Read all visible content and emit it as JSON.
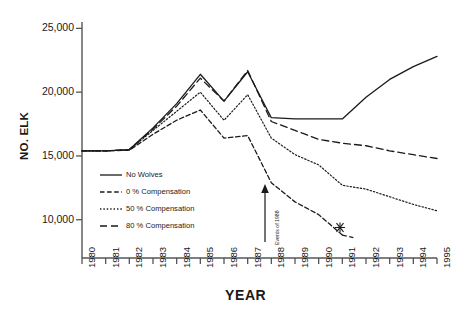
{
  "chart_data": {
    "type": "line",
    "title": "",
    "xlabel": "YEAR",
    "ylabel": "NO. ELK",
    "x": [
      1980,
      1981,
      1982,
      1983,
      1984,
      1985,
      1986,
      1987,
      1988,
      1989,
      1990,
      1991,
      1992,
      1993,
      1994,
      1995
    ],
    "categories": [
      "1980",
      "1981",
      "1982",
      "1983",
      "1984",
      "1985",
      "1986",
      "1987",
      "1988",
      "1989",
      "1990",
      "1991",
      "1992",
      "1993",
      "1994",
      "1995"
    ],
    "xlim": [
      1980,
      1995
    ],
    "ylim": [
      7000,
      25500
    ],
    "yticks": [
      10000,
      15000,
      20000,
      25000
    ],
    "ytick_labels": [
      "10,000",
      "15,000",
      "20,000",
      "25,000"
    ],
    "grid": false,
    "legend_position": "inside-lower-left",
    "series": [
      {
        "name": "No Wolves",
        "style": "solid",
        "values": [
          15400,
          15400,
          15500,
          17200,
          19100,
          21400,
          19300,
          21600,
          18000,
          17900,
          17900,
          17900,
          19600,
          21000,
          22000,
          22800
        ]
      },
      {
        "name": "0 % Compensation",
        "style": "dash-dot",
        "values": [
          15400,
          15400,
          15450,
          16700,
          17800,
          18600,
          16400,
          16600,
          12900,
          11400,
          10400,
          8800,
          null,
          null,
          null,
          null
        ],
        "end_marker": "asterisk",
        "end_marker_year": 1991,
        "end_marker_value": 8600
      },
      {
        "name": "50 % Compensation",
        "style": "dotted",
        "values": [
          15400,
          15400,
          15480,
          17000,
          18500,
          20000,
          17800,
          19800,
          16400,
          15100,
          14300,
          12700,
          12400,
          11800,
          11200,
          10700
        ]
      },
      {
        "name": "80 % Compensation",
        "style": "dashed",
        "values": [
          15400,
          15400,
          15500,
          17100,
          18900,
          21100,
          19300,
          21700,
          17700,
          17000,
          16300,
          16000,
          15800,
          15400,
          15100,
          14800
        ]
      }
    ],
    "annotations": [
      {
        "text": "Events of 1988",
        "x": 1988,
        "arrow": "up",
        "orientation": "vertical"
      }
    ]
  },
  "legend": {
    "items": [
      {
        "label": "No Wolves",
        "style": "solid"
      },
      {
        "label": "0 % Compensation",
        "style": "dash-dot"
      },
      {
        "label": "50 % Compensation",
        "style": "dotted"
      },
      {
        "label": "80 % Compensation",
        "style": "dashed"
      }
    ]
  },
  "colors": {
    "ink": "#1a1a1a",
    "axis": "#555555",
    "background": "#ffffff"
  }
}
